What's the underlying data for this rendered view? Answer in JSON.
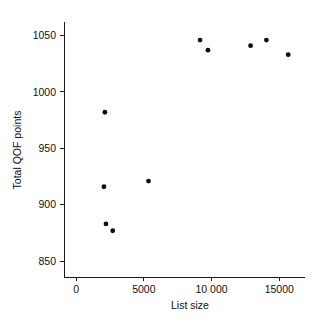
{
  "chart_data": {
    "type": "scatter",
    "title": "",
    "xlabel": "List size",
    "ylabel": "Total QOF points",
    "xlim": [
      -900,
      16900
    ],
    "ylim": [
      836,
      1062
    ],
    "xticks": [
      0,
      5000,
      10000,
      15000
    ],
    "xticklabels": [
      "0",
      "5000",
      "10 000",
      "15000"
    ],
    "yticks": [
      850,
      900,
      950,
      1000,
      1050
    ],
    "yticklabels": [
      "850",
      "900",
      "950",
      "1000",
      "1050"
    ],
    "grid": false,
    "legend": null,
    "marker": "circle",
    "marker_color": "#0d0d0d",
    "marker_size": 2.4,
    "points": [
      {
        "x": 2120,
        "y": 982
      },
      {
        "x": 2050,
        "y": 916
      },
      {
        "x": 2200,
        "y": 883
      },
      {
        "x": 2700,
        "y": 877
      },
      {
        "x": 5340,
        "y": 921
      },
      {
        "x": 9150,
        "y": 1046
      },
      {
        "x": 9730,
        "y": 1037
      },
      {
        "x": 12880,
        "y": 1041
      },
      {
        "x": 14050,
        "y": 1046
      },
      {
        "x": 15660,
        "y": 1033
      }
    ]
  },
  "figure": {
    "background_color": "#ffffff",
    "axis_color": "#1a1a1a",
    "text_color": "#111111",
    "top_caption": ""
  }
}
